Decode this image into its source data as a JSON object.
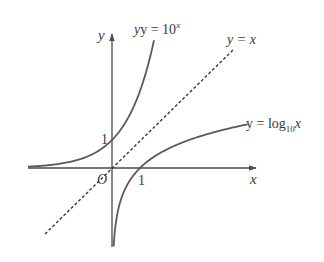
{
  "figure": {
    "axes": {
      "x_label": "x",
      "y_label": "y",
      "origin_label": "O",
      "x_tick_label": "1",
      "y_tick_label": "1"
    },
    "curves": [
      {
        "id": "exponential",
        "label_prefix": "y = 10",
        "label_sup": "x",
        "style": "solid"
      },
      {
        "id": "identity",
        "label": "y = x",
        "style": "dashed"
      },
      {
        "id": "logarithm",
        "label_prefix": "y = log",
        "label_sub": "10",
        "label_suffix": "x",
        "style": "solid"
      }
    ],
    "colors": {
      "curve": "#5a5a5a",
      "axis": "#4a4a4a",
      "text": "#3a3a3a",
      "background": "#ffffff"
    }
  }
}
